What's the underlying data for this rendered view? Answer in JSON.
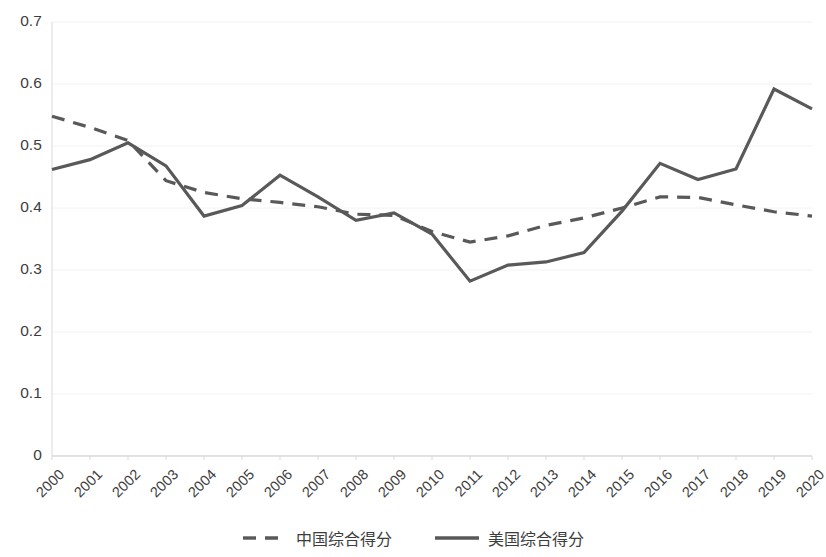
{
  "chart_data": {
    "type": "line",
    "title": "",
    "subtitle": "",
    "xlabel": "",
    "ylabel": "",
    "grid": true,
    "legend_position": "bottom",
    "x": [
      "2000",
      "2001",
      "2002",
      "2003",
      "2004",
      "2005",
      "2006",
      "2007",
      "2008",
      "2009",
      "2010",
      "2011",
      "2012",
      "2013",
      "2014",
      "2015",
      "2016",
      "2017",
      "2018",
      "2019",
      "2020"
    ],
    "categories": [
      "2000",
      "2001",
      "2002",
      "2003",
      "2004",
      "2005",
      "2006",
      "2007",
      "2008",
      "2009",
      "2010",
      "2011",
      "2012",
      "2013",
      "2014",
      "2015",
      "2016",
      "2017",
      "2018",
      "2019",
      "2020"
    ],
    "xlim": [
      2000,
      2020
    ],
    "ylim": [
      0,
      0.7
    ],
    "yticks": [
      0,
      0.1,
      0.2,
      0.3,
      0.4,
      0.5,
      0.6,
      0.7
    ],
    "ytick_labels": [
      "0",
      "0.1",
      "0.2",
      "0.3",
      "0.4",
      "0.5",
      "0.6",
      "0.7"
    ],
    "series": [
      {
        "name": "中国综合得分",
        "style": "dashed",
        "color": "#595959",
        "values": [
          0.548,
          0.53,
          0.509,
          0.444,
          0.425,
          0.415,
          0.409,
          0.402,
          0.39,
          0.388,
          0.362,
          0.345,
          0.355,
          0.372,
          0.384,
          0.4,
          0.418,
          0.417,
          0.405,
          0.394,
          0.387
        ]
      },
      {
        "name": "美国综合得分",
        "style": "solid",
        "color": "#595959",
        "values": [
          0.462,
          0.478,
          0.505,
          0.468,
          0.387,
          0.404,
          0.453,
          0.418,
          0.38,
          0.392,
          0.358,
          0.282,
          0.308,
          0.313,
          0.328,
          0.395,
          0.472,
          0.446,
          0.463,
          0.592,
          0.56
        ]
      }
    ]
  },
  "legend": {
    "items": [
      {
        "label": "中国综合得分",
        "style": "dashed"
      },
      {
        "label": "美国综合得分",
        "style": "solid"
      }
    ]
  },
  "axes": {
    "y_tick_labels": [
      "0.7",
      "0.6",
      "0.5",
      "0.4",
      "0.3",
      "0.2",
      "0.1",
      "0"
    ],
    "x_tick_labels": [
      "2000",
      "2001",
      "2002",
      "2003",
      "2004",
      "2005",
      "2006",
      "2007",
      "2008",
      "2009",
      "2010",
      "2011",
      "2012",
      "2013",
      "2014",
      "2015",
      "2016",
      "2017",
      "2018",
      "2019",
      "2020"
    ]
  },
  "colors": {
    "line": "#595959",
    "grid": "#f2f2f2",
    "axis": "#d9d9d9",
    "text": "#3d3d3d"
  }
}
